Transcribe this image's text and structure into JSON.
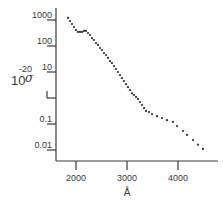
{
  "chart_data": {
    "type": "scatter",
    "title": "",
    "xlabel": "Å",
    "ylabel_base": "10",
    "ylabel_exponent": "-20",
    "ylabel_symbol": "σ",
    "ylabel": "10^-20 σ",
    "yscale": "log",
    "xlim": [
      1700,
      4750
    ],
    "ylim": [
      0.005,
      1500
    ],
    "grid": false,
    "legend": null,
    "x_ticks": [
      {
        "value": 2000,
        "label": "2000"
      },
      {
        "value": 3000,
        "label": "3000"
      },
      {
        "value": 4000,
        "label": "4000"
      }
    ],
    "y_ticks": [
      {
        "value": 1000,
        "label": "1000"
      },
      {
        "value": 100,
        "label": "100"
      },
      {
        "value": 10,
        "label": "10"
      },
      {
        "value": 1,
        "label": ""
      },
      {
        "value": 0.1,
        "label": "0.1"
      },
      {
        "value": 0.01,
        "label": "0.01"
      }
    ],
    "series": [
      {
        "name": "cross section",
        "marker": "dot",
        "color": "#2e2e2e",
        "x": [
          1843,
          1882,
          1922,
          1961,
          2000,
          2039,
          2078,
          2118,
          2157,
          2196,
          2235,
          2275,
          2314,
          2353,
          2392,
          2431,
          2471,
          2510,
          2549,
          2588,
          2627,
          2667,
          2706,
          2745,
          2784,
          2824,
          2863,
          2902,
          2941,
          2980,
          3020,
          3059,
          3098,
          3137,
          3176,
          3216,
          3255,
          3294,
          3333,
          3373,
          3431,
          3490,
          3588,
          3686,
          3784,
          3902,
          3980,
          4098,
          4176,
          4294,
          4392,
          4490
        ],
        "y": [
          1200,
          910,
          700,
          540,
          410,
          350,
          350,
          350,
          380,
          380,
          315,
          265,
          200,
          170,
          130,
          110,
          84,
          70,
          54,
          45,
          35,
          26,
          22,
          17,
          13,
          10,
          7.7,
          5.9,
          4.5,
          3.4,
          2.6,
          2.0,
          1.5,
          1.3,
          1.1,
          0.92,
          0.7,
          0.54,
          0.41,
          0.32,
          0.29,
          0.24,
          0.2,
          0.17,
          0.14,
          0.12,
          0.084,
          0.054,
          0.038,
          0.024,
          0.016,
          0.011
        ]
      }
    ]
  },
  "axes": {
    "x_tick_labels": [
      "2000",
      "3000",
      "4000"
    ],
    "y_tick_labels": [
      "1000",
      "100",
      "10",
      "",
      "0.1",
      "0.01"
    ],
    "x_unit": "Å"
  }
}
